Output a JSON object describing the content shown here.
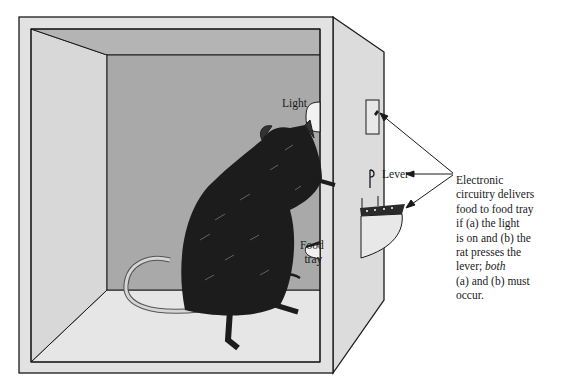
{
  "figure": {
    "labels": {
      "light": "Light",
      "lever": "Lever",
      "food_tray_line1": "Food",
      "food_tray_line2": "tray"
    },
    "caption": {
      "lines": [
        "Electronic",
        "circuitry delivers",
        "food to food tray",
        "if (a) the light",
        "is on and (b) the",
        "rat presses the"
      ],
      "line7_prefix": "lever; ",
      "line7_italic": "both",
      "line8": "(a) and (b) must",
      "line9": "occur."
    },
    "colors": {
      "frame": "#e2e2e2",
      "side_wall": "#dcdcdc",
      "ceiling": "#b4b4b4",
      "back_wall": "#a9a9a9",
      "left_wall": "#d8d8d8",
      "floor": "#e6e6e6",
      "outline": "#1a1a1a",
      "rat": "#1c1c1c"
    }
  }
}
